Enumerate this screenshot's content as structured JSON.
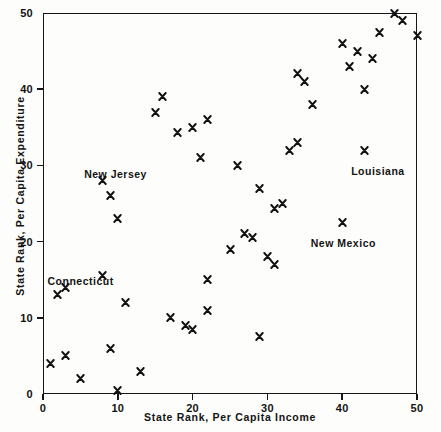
{
  "chart_data": {
    "type": "scatter",
    "title": "",
    "xlabel": "State Rank, Per Capita Income",
    "ylabel": "State Rank, Per Capita Expenditure",
    "xlim": [
      0,
      50
    ],
    "ylim": [
      0,
      50
    ],
    "xticks": [
      0,
      10,
      20,
      30,
      40,
      50
    ],
    "yticks": [
      0,
      10,
      20,
      30,
      40,
      50
    ],
    "xtick_labels": [
      "0",
      "10",
      "20",
      "30",
      "40",
      "50"
    ],
    "ytick_labels": [
      "0",
      "10",
      "20",
      "30",
      "40",
      "50"
    ],
    "grid": false,
    "legend": null,
    "marker": "x",
    "points": [
      {
        "x": 1,
        "y": 4
      },
      {
        "x": 3,
        "y": 5
      },
      {
        "x": 5,
        "y": 2
      },
      {
        "x": 9,
        "y": 6
      },
      {
        "x": 10,
        "y": 0.5
      },
      {
        "x": 13,
        "y": 3
      },
      {
        "x": 2,
        "y": 13
      },
      {
        "x": 3,
        "y": 14
      },
      {
        "x": 8,
        "y": 15.5
      },
      {
        "x": 11,
        "y": 12
      },
      {
        "x": 17,
        "y": 10
      },
      {
        "x": 19,
        "y": 9
      },
      {
        "x": 20,
        "y": 8.5
      },
      {
        "x": 22,
        "y": 11
      },
      {
        "x": 29,
        "y": 7.5
      },
      {
        "x": 22,
        "y": 15
      },
      {
        "x": 25,
        "y": 19
      },
      {
        "x": 27,
        "y": 21
      },
      {
        "x": 28,
        "y": 20.5
      },
      {
        "x": 30,
        "y": 18
      },
      {
        "x": 31,
        "y": 17
      },
      {
        "x": 8,
        "y": 28
      },
      {
        "x": 9,
        "y": 26
      },
      {
        "x": 10,
        "y": 23
      },
      {
        "x": 15,
        "y": 37
      },
      {
        "x": 16,
        "y": 39
      },
      {
        "x": 18,
        "y": 34.3
      },
      {
        "x": 20,
        "y": 35
      },
      {
        "x": 21,
        "y": 31
      },
      {
        "x": 22,
        "y": 36
      },
      {
        "x": 26,
        "y": 30
      },
      {
        "x": 29,
        "y": 27
      },
      {
        "x": 31,
        "y": 24.3
      },
      {
        "x": 32,
        "y": 25
      },
      {
        "x": 34,
        "y": 42
      },
      {
        "x": 35,
        "y": 41
      },
      {
        "x": 33,
        "y": 32
      },
      {
        "x": 36,
        "y": 38
      },
      {
        "x": 34,
        "y": 33
      },
      {
        "x": 40,
        "y": 46
      },
      {
        "x": 42,
        "y": 45
      },
      {
        "x": 44,
        "y": 44
      },
      {
        "x": 41,
        "y": 43
      },
      {
        "x": 43,
        "y": 40
      },
      {
        "x": 45,
        "y": 47.5
      },
      {
        "x": 47,
        "y": 50
      },
      {
        "x": 48,
        "y": 49
      },
      {
        "x": 50,
        "y": 47
      },
      {
        "x": 43,
        "y": 32
      },
      {
        "x": 40,
        "y": 22.5
      }
    ],
    "annotations": [
      {
        "label": "New Jersey",
        "x": 5.5,
        "y": 29.6
      },
      {
        "label": "Connecticut",
        "x": 0.6,
        "y": 15.6
      },
      {
        "label": "Louisiana",
        "x": 41.2,
        "y": 30.0
      },
      {
        "label": "New Mexico",
        "x": 35.8,
        "y": 20.6
      }
    ]
  },
  "figure": {
    "background_color": "#fdfdfb",
    "axis_color": "#16161a",
    "marker_color": "#111111"
  }
}
